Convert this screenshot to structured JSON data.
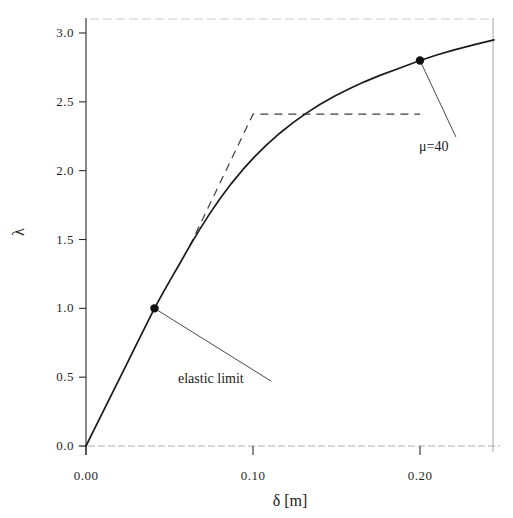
{
  "chart_data": {
    "type": "line",
    "title": "",
    "xlabel": "δ [m]",
    "ylabel": "λ",
    "xlim": [
      0.0,
      0.2443
    ],
    "ylim": [
      0.0,
      3.0
    ],
    "grid": false,
    "legend": null,
    "xticks": [
      0.0,
      0.1,
      0.2
    ],
    "xtick_labels": [
      "0.00",
      "0.10",
      "0.20"
    ],
    "yticks": [
      0.0,
      0.5,
      1.0,
      1.5,
      2.0,
      2.5,
      3.0
    ],
    "ytick_labels": [
      "0.0",
      "0.5",
      "1.0",
      "1.5",
      "2.0",
      "2.5",
      "3.0"
    ],
    "series": [
      {
        "name": "capacity curve",
        "style": "solid",
        "color": "#1a1a1a",
        "x": [
          0.0,
          0.005,
          0.01,
          0.015,
          0.02,
          0.025,
          0.03,
          0.035,
          0.041,
          0.046,
          0.051,
          0.056,
          0.062,
          0.068,
          0.074,
          0.08,
          0.087,
          0.094,
          0.101,
          0.108,
          0.116,
          0.124,
          0.132,
          0.14,
          0.149,
          0.158,
          0.167,
          0.176,
          0.186,
          0.2,
          0.21,
          0.22,
          0.232,
          0.2443
        ],
        "y": [
          0.0,
          0.122,
          0.244,
          0.366,
          0.488,
          0.61,
          0.732,
          0.854,
          1.0,
          1.11,
          1.218,
          1.322,
          1.45,
          1.572,
          1.686,
          1.793,
          1.906,
          2.009,
          2.102,
          2.186,
          2.272,
          2.349,
          2.418,
          2.48,
          2.542,
          2.597,
          2.647,
          2.692,
          2.737,
          2.8,
          2.84,
          2.876,
          2.914,
          2.95
        ]
      },
      {
        "name": "bilinear idealization",
        "style": "dashed",
        "color": "#3c3c3c",
        "x": [
          0.062,
          0.1,
          0.2
        ],
        "y": [
          1.45,
          2.41,
          2.41
        ]
      }
    ],
    "markers": [
      {
        "name": "elastic-limit",
        "x": 0.041,
        "y": 1.0,
        "label": "elastic limit"
      },
      {
        "name": "ductility-point",
        "x": 0.2,
        "y": 2.8,
        "label": "μ=40"
      }
    ],
    "annotations": [
      {
        "id": "elastic-limit",
        "text": "elastic limit",
        "anchor_x": 0.041,
        "anchor_y": 1.0,
        "text_x": 0.111,
        "text_y": 0.47
      },
      {
        "id": "mu-40",
        "text": "μ=40",
        "anchor_x": 0.2,
        "anchor_y": 2.8,
        "text_x": 0.2215,
        "text_y": 2.245
      }
    ]
  },
  "axes": {
    "y_title": "λ",
    "x_title": "δ [m]"
  },
  "annotations": {
    "elastic_limit": "elastic limit",
    "mu": "μ=40"
  },
  "style": {
    "background": "#ffffff",
    "axis_color": "#2a2a2a",
    "curve_color": "#1a1a1a",
    "dashed_color": "#3c3c3c",
    "marker_color": "#111111",
    "leader_color": "#4a4a4a"
  }
}
